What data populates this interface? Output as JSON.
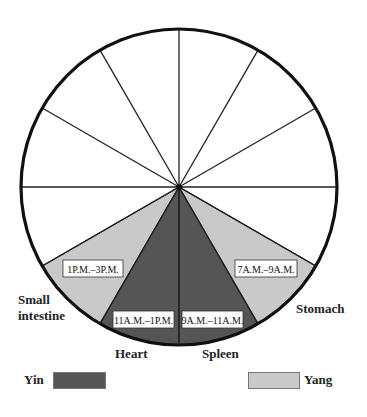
{
  "diagram": {
    "type": "organ-clock-wheel",
    "segments_total": 12,
    "colors": {
      "yin": "#555555",
      "yang": "#c9c9c9",
      "outline": "#111111",
      "empty": "#ffffff"
    },
    "shaded_segments": [
      {
        "organ": "Small intestine",
        "time": "1P.M.–3P.M.",
        "type": "yang"
      },
      {
        "organ": "Heart",
        "time": "11A.M.–1P.M.",
        "type": "yin"
      },
      {
        "organ": "Spleen",
        "time": "9A.M.–11A.M.",
        "type": "yin"
      },
      {
        "organ": "Stomach",
        "time": "7A.M.–9A.M.",
        "type": "yang"
      }
    ]
  },
  "labels": {
    "small_intestine_line1": "Small",
    "small_intestine_line2": "intestine",
    "heart": "Heart",
    "spleen": "Spleen",
    "stomach": "Stomach"
  },
  "times": {
    "small_intestine": "1P.M.–3P.M.",
    "heart": "11A.M.–1P.M.",
    "spleen": "9A.M.–11A.M.",
    "stomach": "7A.M.–9A.M."
  },
  "legend": {
    "yin_label": "Yin",
    "yang_label": "Yang"
  }
}
